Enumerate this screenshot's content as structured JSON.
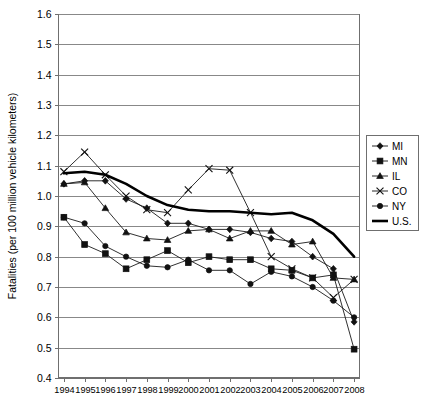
{
  "chart_data": {
    "type": "line",
    "title": "",
    "xlabel": "",
    "ylabel": "Fatalities (per 100 million vehicle kilometers)",
    "x": [
      1994,
      1995,
      1996,
      1997,
      1998,
      1999,
      2000,
      2001,
      2002,
      2003,
      2004,
      2005,
      2006,
      2007,
      2008
    ],
    "xtick_labels": [
      "1994",
      "1995",
      "1996",
      "1997",
      "1998",
      "1999",
      "2000",
      "2001",
      "2002",
      "2003",
      "2004",
      "2005",
      "2006",
      "2007",
      "2008"
    ],
    "ytick_labels": [
      "0.4",
      "0.5",
      "0.6",
      "0.7",
      "0.8",
      "0.9",
      "1.0",
      "1.1",
      "1.2",
      "1.3",
      "1.4",
      "1.5",
      "1.6"
    ],
    "ylim": [
      0.4,
      1.6
    ],
    "ytick_step": 0.1,
    "grid": "horizontal",
    "legend_position": "right",
    "series": [
      {
        "name": "MI",
        "marker": "diamond",
        "values": [
          1.04,
          1.05,
          1.05,
          0.99,
          0.96,
          0.91,
          0.91,
          0.89,
          0.89,
          0.88,
          0.86,
          0.85,
          0.8,
          0.76,
          0.585
        ]
      },
      {
        "name": "MN",
        "marker": "square",
        "values": [
          0.93,
          0.84,
          0.81,
          0.76,
          0.79,
          0.82,
          0.78,
          0.8,
          0.79,
          0.79,
          0.76,
          0.755,
          0.73,
          0.74,
          0.495
        ]
      },
      {
        "name": "IL",
        "marker": "triangle",
        "values": [
          1.04,
          1.045,
          0.96,
          0.88,
          0.86,
          0.855,
          0.885,
          0.89,
          0.86,
          0.885,
          0.885,
          0.84,
          0.85,
          0.73,
          0.725
        ]
      },
      {
        "name": "CO",
        "marker": "x",
        "values": [
          1.08,
          1.145,
          1.07,
          1.0,
          0.955,
          0.945,
          1.02,
          1.09,
          1.085,
          0.945,
          0.8,
          0.76,
          0.73,
          0.665,
          0.725
        ]
      },
      {
        "name": "NY",
        "marker": "circle",
        "values": [
          0.93,
          0.91,
          0.835,
          0.8,
          0.77,
          0.765,
          0.79,
          0.755,
          0.755,
          0.71,
          0.75,
          0.735,
          0.7,
          0.655,
          0.6
        ]
      },
      {
        "name": "U.S.",
        "marker": "line",
        "values": [
          1.075,
          1.08,
          1.07,
          1.04,
          1.0,
          0.97,
          0.955,
          0.95,
          0.95,
          0.945,
          0.94,
          0.945,
          0.92,
          0.875,
          0.8
        ]
      }
    ],
    "legend_entries": [
      "MI",
      "MN",
      "IL",
      "CO",
      "NY",
      "U.S."
    ]
  }
}
